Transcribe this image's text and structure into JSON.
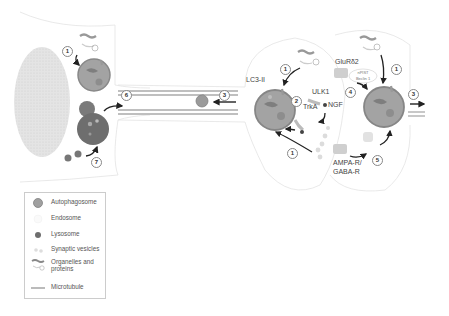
{
  "diagram": {
    "labels": {
      "lc3": "LC3-II",
      "ulk1": "ULK1",
      "trka": "TrkA",
      "ngf": "NGF",
      "glurd2": "GluRδ2",
      "npist": "nPIST",
      "beclin": "Beclin 1",
      "ampa": "AMPA-R/",
      "gaba": "GABA-R"
    },
    "step_numbers": {
      "soma_1": "1",
      "soma_7": "7",
      "axon_6": "6",
      "axon_3": "3",
      "pre_1_top": "1",
      "pre_2": "2",
      "pre_1_bottom": "1",
      "post_1": "1",
      "post_4": "4",
      "post_5": "5",
      "post_3": "3"
    },
    "colors": {
      "autophagosome": "#9a9a9a",
      "autophagosome_rim": "#7a7a7a",
      "lysosome": "#6f6f6f",
      "microtubule": "#a8a8a8",
      "nucleus": "#e2e2e2",
      "membrane": "#dddddd",
      "arrow": "#222222"
    }
  },
  "legend": {
    "items": [
      {
        "icon": "autophagosome-icon",
        "label": "Autophagosome"
      },
      {
        "icon": "endosome-icon",
        "label": "Endosome"
      },
      {
        "icon": "lysosome-icon",
        "label": "Lysosome"
      },
      {
        "icon": "synaptic-vesicles-icon",
        "label": "Synaptic vesicles"
      },
      {
        "icon": "organelles-proteins-icon",
        "label": "Organelles and proteins"
      },
      {
        "icon": "microtubule-icon",
        "label": "Microtubule"
      }
    ]
  }
}
